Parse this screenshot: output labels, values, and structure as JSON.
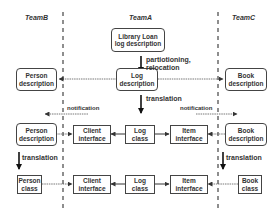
{
  "teams": {
    "team_b": "TeamB",
    "team_a": "TeamA",
    "team_c": "TeamC"
  },
  "nodes": {
    "library_loan": "Library Loan\nlog description",
    "person_description_1": "Person\ndescription",
    "log_description": "Log\ndescription",
    "book_description_1": "Book\ndescription",
    "person_description_2": "Person\ndescription",
    "client_interface_1": "Client\ninterface",
    "log_class_1": "Log\nclass",
    "item_interface_1": "Item\ninterface",
    "book_description_2": "Book\ndescription",
    "person_class": "Person\nclass",
    "client_interface_2": "Client\ninterface",
    "log_class_2": "Log\nclass",
    "item_interface_2": "Item\ninterface",
    "book_class": "Book\nclass"
  },
  "labels": {
    "partitioning": "partiotioning,\nrelocation",
    "translation_center": "translation",
    "notification_left": "notification",
    "notification_right": "notification",
    "translation_left": "translation",
    "translation_right": "translation"
  },
  "colors": {
    "line": "#444444",
    "background": "#ffffff"
  }
}
